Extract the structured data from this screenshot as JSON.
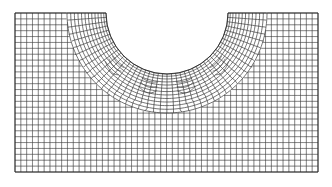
{
  "figure": {
    "line_color": "#3a3a3a",
    "background_color": "#ffffff",
    "elements": "quadrilateral",
    "structured_region": "uniform rectangular grid",
    "refined_region": "radially refined ring around semicircular notch with transition zones"
  }
}
